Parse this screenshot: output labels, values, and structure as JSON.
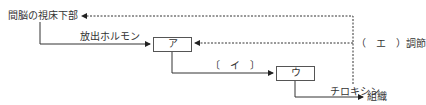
{
  "nodes": {
    "hypothalamus": "間脳の視床下部",
    "a": "ア",
    "u": "ウ",
    "tissue": "組織"
  },
  "labels": {
    "releasing_hormone": "放出ホルモン",
    "i": "〔　イ　〕",
    "thyroxine": "チロキシン",
    "regulation": "（　エ　）調節"
  }
}
